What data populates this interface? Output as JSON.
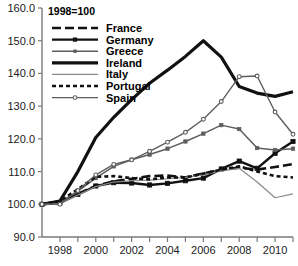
{
  "chart_data": {
    "type": "line",
    "title": "",
    "annotation": "1998=100",
    "xlabel": "",
    "ylabel": "",
    "xlim": [
      1997,
      2011
    ],
    "ylim": [
      90,
      160
    ],
    "yticks": [
      "90.0",
      "100.0",
      "110.0",
      "120.0",
      "130.0",
      "140.0",
      "150.0",
      "160.0"
    ],
    "ytick_values": [
      90,
      100,
      110,
      120,
      130,
      140,
      150,
      160
    ],
    "xticks": [
      "1998",
      "2000",
      "2002",
      "2004",
      "2006",
      "2008",
      "2010"
    ],
    "xtick_values": [
      1998,
      2000,
      2002,
      2004,
      2006,
      2008,
      2010
    ],
    "x": [
      1997,
      1998,
      1999,
      2000,
      2001,
      2002,
      2003,
      2004,
      2005,
      2006,
      2007,
      2008,
      2009,
      2010,
      2011
    ],
    "grid": false,
    "legend_position": "top-left",
    "series": [
      {
        "name": "France",
        "color": "#111111",
        "style": "long-dash",
        "width": 2.6,
        "marker": "none",
        "values": [
          100.0,
          100.6,
          103.2,
          105.6,
          107.0,
          107.8,
          108.6,
          108.8,
          108.2,
          109.4,
          110.6,
          111.2,
          110.6,
          111.4,
          112.3
        ]
      },
      {
        "name": "Germany",
        "color": "#111111",
        "style": "solid",
        "width": 2.4,
        "marker": "square",
        "values": [
          100.0,
          100.4,
          103.0,
          105.6,
          106.6,
          106.5,
          105.9,
          106.4,
          107.2,
          108.0,
          110.8,
          113.2,
          111.0,
          115.6,
          119.2
        ]
      },
      {
        "name": "Greece",
        "color": "#5e5e5e",
        "style": "solid",
        "width": 1.5,
        "marker": "square-small",
        "values": [
          100.0,
          100.6,
          104.0,
          108.0,
          111.6,
          113.6,
          115.2,
          117.0,
          119.2,
          121.6,
          124.2,
          123.0,
          117.2,
          116.6,
          117.0
        ]
      },
      {
        "name": "Ireland",
        "color": "#111111",
        "style": "solid",
        "width": 3.2,
        "marker": "none",
        "values": [
          100.0,
          101.0,
          110.0,
          120.4,
          126.6,
          132.0,
          137.0,
          141.0,
          145.2,
          150.0,
          145.0,
          136.0,
          134.0,
          133.0,
          134.4
        ]
      },
      {
        "name": "Italy",
        "color": "#8a8a8a",
        "style": "solid",
        "width": 1.2,
        "marker": "none",
        "values": [
          100.0,
          100.2,
          102.8,
          105.4,
          106.8,
          107.2,
          107.4,
          107.8,
          108.2,
          109.0,
          110.2,
          111.0,
          106.8,
          102.0,
          103.2
        ]
      },
      {
        "name": "Portugal",
        "color": "#111111",
        "style": "short-dash",
        "width": 2.6,
        "marker": "none",
        "values": [
          100.0,
          101.0,
          104.6,
          108.4,
          108.6,
          108.0,
          107.6,
          108.2,
          108.2,
          109.4,
          110.6,
          111.6,
          110.0,
          108.6,
          108.2
        ]
      },
      {
        "name": "Spain",
        "color": "#5e5e5e",
        "style": "solid",
        "width": 1.4,
        "marker": "circle",
        "values": [
          100.0,
          100.0,
          104.2,
          109.0,
          112.2,
          113.6,
          116.2,
          119.0,
          122.0,
          126.0,
          131.4,
          139.0,
          139.2,
          128.2,
          121.4
        ]
      }
    ]
  }
}
